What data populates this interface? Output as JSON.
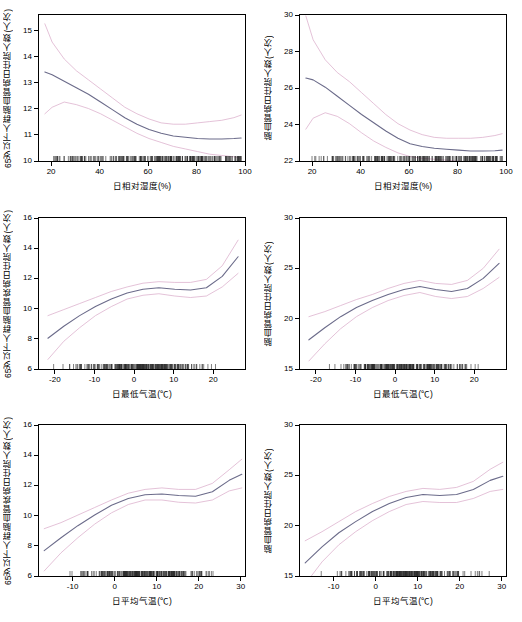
{
  "chart_data": [
    {
      "id": "p1",
      "type": "line",
      "title": "",
      "xlabel": "日相对湿度(%)",
      "ylabel": "65岁以下人群脑血管病日住院人数(人次)",
      "xlim": [
        15,
        100
      ],
      "ylim": [
        10,
        15.6
      ],
      "xticks": [
        20,
        40,
        60,
        80,
        100
      ],
      "yticks": [
        10,
        11,
        12,
        13,
        14,
        15
      ],
      "grid": false,
      "legend": "none",
      "series": [
        {
          "name": "fit",
          "x": [
            17,
            20,
            25,
            30,
            35,
            40,
            45,
            50,
            55,
            60,
            65,
            70,
            75,
            80,
            85,
            90,
            95,
            98
          ],
          "values": [
            13.45,
            13.35,
            13.1,
            12.85,
            12.6,
            12.3,
            12.0,
            11.7,
            11.45,
            11.25,
            11.1,
            11.0,
            10.95,
            10.9,
            10.88,
            10.88,
            10.9,
            10.92
          ]
        },
        {
          "name": "upper_ci",
          "x": [
            17,
            20,
            25,
            30,
            35,
            40,
            45,
            50,
            55,
            60,
            65,
            70,
            75,
            80,
            85,
            90,
            95,
            98
          ],
          "values": [
            15.3,
            14.6,
            13.95,
            13.5,
            13.15,
            12.8,
            12.45,
            12.1,
            11.85,
            11.65,
            11.5,
            11.45,
            11.45,
            11.5,
            11.55,
            11.6,
            11.7,
            11.8
          ]
        },
        {
          "name": "lower_ci",
          "x": [
            17,
            20,
            25,
            30,
            35,
            40,
            45,
            50,
            55,
            60,
            65,
            70,
            75,
            80,
            85,
            90,
            95,
            98
          ],
          "values": [
            11.85,
            12.1,
            12.3,
            12.2,
            12.05,
            11.85,
            11.6,
            11.35,
            11.1,
            10.9,
            10.75,
            10.6,
            10.5,
            10.4,
            10.3,
            10.25,
            10.2,
            10.15
          ]
        }
      ],
      "rug": true
    },
    {
      "id": "p2",
      "type": "line",
      "title": "",
      "xlabel": "日相对湿度(%)",
      "ylabel": "脑血管病日住院人数(人次)",
      "xlim": [
        15,
        100
      ],
      "ylim": [
        22,
        30
      ],
      "xticks": [
        20,
        40,
        60,
        80,
        100
      ],
      "yticks": [
        22,
        24,
        26,
        28,
        30
      ],
      "grid": false,
      "legend": "none",
      "series": [
        {
          "name": "fit",
          "x": [
            17,
            20,
            25,
            30,
            35,
            40,
            45,
            50,
            55,
            60,
            65,
            70,
            75,
            80,
            85,
            90,
            95,
            98
          ],
          "values": [
            26.6,
            26.5,
            26.1,
            25.6,
            25.1,
            24.6,
            24.15,
            23.7,
            23.3,
            23.0,
            22.85,
            22.75,
            22.7,
            22.65,
            22.6,
            22.6,
            22.62,
            22.65
          ]
        },
        {
          "name": "upper_ci",
          "x": [
            17,
            20,
            25,
            30,
            35,
            40,
            45,
            50,
            55,
            60,
            65,
            70,
            75,
            80,
            85,
            90,
            95,
            98
          ],
          "values": [
            30.0,
            28.7,
            27.6,
            26.9,
            26.4,
            25.8,
            25.2,
            24.6,
            24.1,
            23.75,
            23.5,
            23.35,
            23.3,
            23.3,
            23.3,
            23.35,
            23.45,
            23.55
          ]
        },
        {
          "name": "lower_ci",
          "x": [
            17,
            20,
            25,
            30,
            35,
            40,
            45,
            50,
            55,
            60,
            65,
            70,
            75,
            80,
            85,
            90,
            95,
            98
          ],
          "values": [
            23.8,
            24.4,
            24.7,
            24.5,
            24.1,
            23.6,
            23.15,
            22.8,
            22.5,
            22.3,
            22.2,
            22.15,
            22.1,
            22.05,
            22.0,
            21.95,
            21.9,
            21.85
          ]
        }
      ],
      "rug": true
    },
    {
      "id": "p3",
      "type": "line",
      "title": "",
      "xlabel": "日最低气温(℃)",
      "ylabel": "65岁以下人群脑血管疾病日住院人数(人次)",
      "xlim": [
        -24,
        28
      ],
      "ylim": [
        6,
        16
      ],
      "xticks": [
        -20,
        -10,
        0,
        10,
        20
      ],
      "yticks": [
        6,
        8,
        10,
        12,
        14,
        16
      ],
      "grid": false,
      "legend": "none",
      "series": [
        {
          "name": "fit",
          "x": [
            -22,
            -18,
            -14,
            -10,
            -6,
            -2,
            2,
            6,
            10,
            14,
            18,
            22,
            26
          ],
          "values": [
            8.1,
            8.9,
            9.6,
            10.2,
            10.7,
            11.1,
            11.35,
            11.45,
            11.35,
            11.3,
            11.45,
            12.2,
            13.5
          ]
        },
        {
          "name": "upper_ci",
          "x": [
            -22,
            -18,
            -14,
            -10,
            -6,
            -2,
            2,
            6,
            10,
            14,
            18,
            22,
            26
          ],
          "values": [
            9.6,
            10.0,
            10.4,
            10.8,
            11.2,
            11.5,
            11.75,
            11.85,
            11.8,
            11.8,
            12.0,
            12.9,
            14.6
          ]
        },
        {
          "name": "lower_ci",
          "x": [
            -22,
            -18,
            -14,
            -10,
            -6,
            -2,
            2,
            6,
            10,
            14,
            18,
            22,
            26
          ],
          "values": [
            6.7,
            7.9,
            8.8,
            9.6,
            10.2,
            10.7,
            10.95,
            11.05,
            10.9,
            10.8,
            10.9,
            11.5,
            12.4
          ]
        }
      ],
      "rug": true
    },
    {
      "id": "p4",
      "type": "line",
      "title": "",
      "xlabel": "日最低气温(℃)",
      "ylabel": "脑血管病日住院人数(人次)",
      "xlim": [
        -24,
        28
      ],
      "ylim": [
        15,
        30
      ],
      "xticks": [
        -20,
        -10,
        0,
        10,
        20
      ],
      "yticks": [
        15,
        20,
        25,
        30
      ],
      "grid": false,
      "legend": "none",
      "series": [
        {
          "name": "fit",
          "x": [
            -22,
            -18,
            -14,
            -10,
            -6,
            -2,
            2,
            6,
            10,
            14,
            18,
            22,
            26
          ],
          "values": [
            18.0,
            19.2,
            20.3,
            21.2,
            21.9,
            22.5,
            23.0,
            23.3,
            23.0,
            22.8,
            23.1,
            24.1,
            25.6
          ]
        },
        {
          "name": "upper_ci",
          "x": [
            -22,
            -18,
            -14,
            -10,
            -6,
            -2,
            2,
            6,
            10,
            14,
            18,
            22,
            26
          ],
          "values": [
            20.3,
            20.8,
            21.4,
            22.0,
            22.5,
            23.1,
            23.6,
            23.9,
            23.6,
            23.5,
            23.9,
            25.1,
            27.0
          ]
        },
        {
          "name": "lower_ci",
          "x": [
            -22,
            -18,
            -14,
            -10,
            -6,
            -2,
            2,
            6,
            10,
            14,
            18,
            22,
            26
          ],
          "values": [
            15.9,
            17.6,
            19.1,
            20.3,
            21.2,
            21.9,
            22.4,
            22.7,
            22.3,
            22.1,
            22.3,
            23.1,
            24.2
          ]
        }
      ],
      "rug": true
    },
    {
      "id": "p5",
      "type": "line",
      "title": "",
      "xlabel": "日平均气温(℃)",
      "ylabel": "65岁以下人群脑血管疾病日住院人数(人次)",
      "xlim": [
        -18,
        31
      ],
      "ylim": [
        6,
        16
      ],
      "xticks": [
        -10,
        0,
        10,
        20,
        30
      ],
      "yticks": [
        6,
        8,
        10,
        12,
        14,
        16
      ],
      "grid": false,
      "legend": "none",
      "series": [
        {
          "name": "fit",
          "x": [
            -17,
            -13,
            -9,
            -5,
            -1,
            3,
            7,
            11,
            15,
            19,
            23,
            27,
            30
          ],
          "values": [
            7.75,
            8.6,
            9.4,
            10.1,
            10.75,
            11.2,
            11.45,
            11.5,
            11.4,
            11.35,
            11.65,
            12.4,
            12.8
          ]
        },
        {
          "name": "upper_ci",
          "x": [
            -17,
            -13,
            -9,
            -5,
            -1,
            3,
            7,
            11,
            15,
            19,
            23,
            27,
            30
          ],
          "values": [
            9.2,
            9.6,
            10.1,
            10.6,
            11.1,
            11.55,
            11.8,
            11.9,
            11.8,
            11.8,
            12.2,
            13.1,
            13.8
          ]
        },
        {
          "name": "lower_ci",
          "x": [
            -17,
            -13,
            -9,
            -5,
            -1,
            3,
            7,
            11,
            15,
            19,
            23,
            27,
            30
          ],
          "values": [
            6.4,
            7.6,
            8.6,
            9.5,
            10.25,
            10.8,
            11.1,
            11.1,
            10.95,
            10.9,
            11.1,
            11.7,
            11.9
          ]
        }
      ],
      "rug": true
    },
    {
      "id": "p6",
      "type": "line",
      "title": "",
      "xlabel": "日平均气温(℃)",
      "ylabel": "脑血管病日住院人数(人次)",
      "xlim": [
        -18,
        31
      ],
      "ylim": [
        15,
        30
      ],
      "xticks": [
        -10,
        0,
        10,
        20,
        30
      ],
      "yticks": [
        15,
        20,
        25,
        30
      ],
      "grid": false,
      "legend": "none",
      "series": [
        {
          "name": "fit",
          "x": [
            -17,
            -13,
            -9,
            -5,
            -1,
            3,
            7,
            11,
            15,
            19,
            23,
            27,
            30
          ],
          "values": [
            16.4,
            18.0,
            19.4,
            20.5,
            21.5,
            22.3,
            22.9,
            23.2,
            23.1,
            23.2,
            23.7,
            24.6,
            25.0
          ]
        },
        {
          "name": "upper_ci",
          "x": [
            -17,
            -13,
            -9,
            -5,
            -1,
            3,
            7,
            11,
            15,
            19,
            23,
            27,
            30
          ],
          "values": [
            18.6,
            19.5,
            20.5,
            21.5,
            22.3,
            23.0,
            23.5,
            23.8,
            23.7,
            23.9,
            24.5,
            25.7,
            26.4
          ]
        },
        {
          "name": "lower_ci",
          "x": [
            -17,
            -13,
            -9,
            -5,
            -1,
            3,
            7,
            11,
            15,
            19,
            23,
            27,
            30
          ],
          "values": [
            14.3,
            16.5,
            18.2,
            19.5,
            20.6,
            21.5,
            22.2,
            22.5,
            22.4,
            22.4,
            22.8,
            23.5,
            23.7
          ]
        }
      ],
      "rug": true
    }
  ],
  "panels": [
    {
      "ylabel": "65岁以下人群脑血管病日住院人数(人次)",
      "xlabel": "日相对湿度(%)",
      "xticks": [
        "20",
        "40",
        "60",
        "80",
        "100"
      ],
      "yticks": [
        "15",
        "14",
        "13",
        "12",
        "11",
        "10"
      ]
    },
    {
      "ylabel": "脑血管病日住院人数(人次)",
      "xlabel": "日相对湿度(%)",
      "xticks": [
        "20",
        "40",
        "60",
        "80",
        "100"
      ],
      "yticks": [
        "30",
        "28",
        "26",
        "24",
        "22"
      ]
    },
    {
      "ylabel": "65岁以下人群脑血管疾病日住院人数(人次)",
      "xlabel": "日最低气温(℃)",
      "xticks": [
        "-20",
        "-10",
        "0",
        "10",
        "20"
      ],
      "yticks": [
        "16",
        "14",
        "12",
        "10",
        "8",
        "6"
      ]
    },
    {
      "ylabel": "脑血管病日住院人数(人次)",
      "xlabel": "日最低气温(℃)",
      "xticks": [
        "-20",
        "-10",
        "0",
        "10",
        "20"
      ],
      "yticks": [
        "30",
        "25",
        "20",
        "15"
      ]
    },
    {
      "ylabel": "65岁以下人群脑血管疾病日住院人数(人次)",
      "xlabel": "日平均气温(℃)",
      "xticks": [
        "-10",
        "0",
        "10",
        "20",
        "30"
      ],
      "yticks": [
        "16",
        "14",
        "12",
        "10",
        "8",
        "6"
      ]
    },
    {
      "ylabel": "脑血管病日住院人数(人次)",
      "xlabel": "日平均气温(℃)",
      "xticks": [
        "-10",
        "0",
        "10",
        "20",
        "30"
      ],
      "yticks": [
        "30",
        "25",
        "20",
        "15"
      ]
    }
  ],
  "colors": {
    "fit": "#6b6b8a",
    "ci": "#d9a7c7",
    "axis": "#000000",
    "rug": "#2b2b2b",
    "background": "#ffffff"
  }
}
